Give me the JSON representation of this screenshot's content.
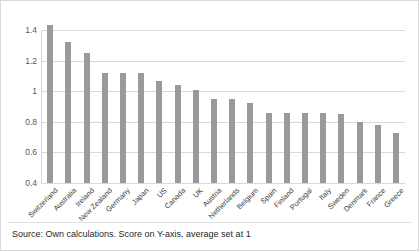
{
  "figure": {
    "caption": "Source: Own calculations. Score on Y-axis, average set at 1",
    "bar_color": "#9a9a9a",
    "grid_color": "#d9d9d9",
    "background": "#ffffff",
    "border_color": "#d9d9d9"
  },
  "chart_data": {
    "type": "bar",
    "title": "",
    "subtitle": "",
    "xlabel": "",
    "ylabel": "",
    "ylim": [
      0.4,
      1.4
    ],
    "yticks": [
      0.4,
      0.6,
      0.8,
      1,
      1.2,
      1.4
    ],
    "ytick_labels": [
      "0.4",
      "0.6",
      "0.8",
      "1",
      "1.2",
      "1.4"
    ],
    "grid": true,
    "grid_axis": "y",
    "legend": false,
    "legend_position": "none",
    "annotation": "Source: Own calculations. Score on Y-axis, average set at 1",
    "categories": [
      "Switzerland",
      "Australia",
      "Ireland",
      "New Zealand",
      "Germany",
      "Japan",
      "US",
      "Canada",
      "UK",
      "Austria",
      "Netherlands",
      "Belgium",
      "Spain",
      "Finland",
      "Portugal",
      "Italy",
      "Sweden",
      "Denmark",
      "France",
      "Greece"
    ],
    "values": [
      1.43,
      1.32,
      1.25,
      1.12,
      1.12,
      1.12,
      1.07,
      1.04,
      1.01,
      0.95,
      0.95,
      0.92,
      0.86,
      0.86,
      0.86,
      0.86,
      0.85,
      0.8,
      0.78,
      0.73
    ]
  }
}
